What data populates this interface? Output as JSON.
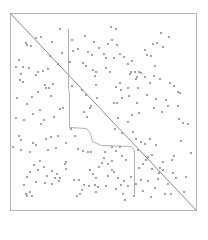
{
  "plot": {
    "frame": {
      "x": 10,
      "y": 13,
      "width": 186,
      "height": 197
    },
    "colors": {
      "frame": "#b4b4b4",
      "diagonal": "#8a8a8a",
      "path": "#b0b0b0",
      "dots": "#8c8c8c",
      "background": "#ffffff"
    },
    "diagonal": {
      "x1": 10,
      "y1": 13,
      "x2": 196,
      "y2": 210
    },
    "path_points": [
      [
        68,
        28
      ],
      [
        68,
        88
      ],
      [
        69,
        92
      ],
      [
        69,
        127
      ],
      [
        86,
        128
      ],
      [
        90,
        133
      ],
      [
        92,
        141
      ],
      [
        101,
        145
      ],
      [
        131,
        146
      ],
      [
        134,
        150
      ],
      [
        134,
        194
      ]
    ],
    "dot_radius": 1.1,
    "dots": [
      [
        60,
        29
      ],
      [
        36,
        38
      ],
      [
        41,
        37
      ],
      [
        27,
        45
      ],
      [
        31,
        46
      ],
      [
        52,
        42
      ],
      [
        62,
        53
      ],
      [
        73,
        51
      ],
      [
        72,
        40
      ],
      [
        78,
        49
      ],
      [
        70,
        62
      ],
      [
        38,
        72
      ],
      [
        43,
        71
      ],
      [
        36,
        75
      ],
      [
        48,
        69
      ],
      [
        58,
        64
      ],
      [
        45,
        85
      ],
      [
        46,
        88
      ],
      [
        49,
        88
      ],
      [
        72,
        86
      ],
      [
        26,
        43
      ],
      [
        50,
        56
      ],
      [
        19,
        60
      ],
      [
        16,
        67
      ],
      [
        23,
        67
      ],
      [
        29,
        68
      ],
      [
        21,
        74
      ],
      [
        20,
        80
      ],
      [
        23,
        82
      ],
      [
        32,
        97
      ],
      [
        38,
        92
      ],
      [
        27,
        104
      ],
      [
        17,
        98
      ],
      [
        16,
        118
      ],
      [
        24,
        120
      ],
      [
        19,
        136
      ],
      [
        21,
        140
      ],
      [
        33,
        143
      ],
      [
        41,
        124
      ],
      [
        54,
        117
      ],
      [
        51,
        96
      ],
      [
        53,
        84
      ],
      [
        40,
        110
      ],
      [
        44,
        120
      ],
      [
        60,
        109
      ],
      [
        63,
        108
      ],
      [
        13,
        147
      ],
      [
        21,
        150
      ],
      [
        36,
        145
      ],
      [
        46,
        139
      ],
      [
        51,
        137
      ],
      [
        33,
        114
      ],
      [
        48,
        150
      ],
      [
        58,
        136
      ],
      [
        71,
        129
      ],
      [
        75,
        136
      ],
      [
        78,
        149
      ],
      [
        83,
        151
      ],
      [
        88,
        152
      ],
      [
        91,
        152
      ],
      [
        66,
        143
      ],
      [
        56,
        148
      ],
      [
        30,
        152
      ],
      [
        34,
        165
      ],
      [
        38,
        170
      ],
      [
        30,
        172
      ],
      [
        27,
        177
      ],
      [
        40,
        161
      ],
      [
        44,
        167
      ],
      [
        52,
        171
      ],
      [
        55,
        178
      ],
      [
        47,
        176
      ],
      [
        57,
        174
      ],
      [
        60,
        178
      ],
      [
        36,
        182
      ],
      [
        24,
        185
      ],
      [
        26,
        194
      ],
      [
        30,
        192
      ],
      [
        27,
        196
      ],
      [
        32,
        196
      ],
      [
        45,
        183
      ],
      [
        52,
        184
      ],
      [
        59,
        181
      ],
      [
        66,
        169
      ],
      [
        65,
        164
      ],
      [
        66,
        162
      ],
      [
        74,
        180
      ],
      [
        79,
        180
      ],
      [
        82,
        190
      ],
      [
        77,
        196
      ],
      [
        80,
        194
      ],
      [
        84,
        185
      ],
      [
        89,
        186
      ],
      [
        96,
        178
      ],
      [
        95,
        185
      ],
      [
        96,
        192
      ],
      [
        98,
        187
      ],
      [
        93,
        174
      ],
      [
        90,
        170
      ],
      [
        99,
        167
      ],
      [
        102,
        163
      ],
      [
        108,
        164
      ],
      [
        114,
        172
      ],
      [
        118,
        178
      ],
      [
        112,
        170
      ],
      [
        108,
        176
      ],
      [
        106,
        186
      ],
      [
        116,
        189
      ],
      [
        121,
        185
      ],
      [
        124,
        181
      ],
      [
        128,
        186
      ],
      [
        123,
        194
      ],
      [
        131,
        177
      ],
      [
        111,
        27
      ],
      [
        116,
        29
      ],
      [
        112,
        40
      ],
      [
        117,
        45
      ],
      [
        108,
        44
      ],
      [
        104,
        54
      ],
      [
        106,
        58
      ],
      [
        114,
        58
      ],
      [
        120,
        54
      ],
      [
        124,
        57
      ],
      [
        106,
        68
      ],
      [
        110,
        72
      ],
      [
        128,
        64
      ],
      [
        132,
        61
      ],
      [
        131,
        72
      ],
      [
        135,
        72
      ],
      [
        139,
        72
      ],
      [
        130,
        74
      ],
      [
        120,
        83
      ],
      [
        116,
        87
      ],
      [
        121,
        90
      ],
      [
        128,
        88
      ],
      [
        136,
        79
      ],
      [
        99,
        48
      ],
      [
        94,
        42
      ],
      [
        85,
        36
      ],
      [
        92,
        55
      ],
      [
        88,
        52
      ],
      [
        83,
        63
      ],
      [
        86,
        66
      ],
      [
        93,
        70
      ],
      [
        96,
        72
      ],
      [
        95,
        76
      ],
      [
        96,
        85
      ],
      [
        82,
        90
      ],
      [
        86,
        95
      ],
      [
        97,
        98
      ],
      [
        91,
        106
      ],
      [
        90,
        108
      ],
      [
        84,
        112
      ],
      [
        87,
        117
      ],
      [
        153,
        44
      ],
      [
        157,
        43
      ],
      [
        161,
        33
      ],
      [
        163,
        47
      ],
      [
        169,
        37
      ],
      [
        145,
        50
      ],
      [
        147,
        55
      ],
      [
        151,
        56
      ],
      [
        155,
        66
      ],
      [
        154,
        76
      ],
      [
        150,
        83
      ],
      [
        160,
        79
      ],
      [
        170,
        83
      ],
      [
        174,
        86
      ],
      [
        178,
        92
      ],
      [
        180,
        93
      ],
      [
        178,
        106
      ],
      [
        166,
        100
      ],
      [
        145,
        77
      ],
      [
        141,
        73
      ],
      [
        137,
        77
      ],
      [
        138,
        88
      ],
      [
        147,
        95
      ],
      [
        156,
        99
      ],
      [
        154,
        108
      ],
      [
        162,
        112
      ],
      [
        168,
        106
      ],
      [
        179,
        119
      ],
      [
        183,
        123
      ],
      [
        188,
        124
      ],
      [
        181,
        141
      ],
      [
        191,
        153
      ],
      [
        174,
        156
      ],
      [
        172,
        160
      ],
      [
        163,
        162
      ],
      [
        160,
        168
      ],
      [
        163,
        170
      ],
      [
        158,
        179
      ],
      [
        168,
        184
      ],
      [
        176,
        178
      ],
      [
        173,
        173
      ],
      [
        186,
        177
      ],
      [
        114,
        103
      ],
      [
        117,
        103
      ],
      [
        122,
        98
      ],
      [
        129,
        96
      ],
      [
        137,
        103
      ],
      [
        139,
        113
      ],
      [
        132,
        115
      ],
      [
        128,
        122
      ],
      [
        118,
        118
      ],
      [
        115,
        129
      ],
      [
        122,
        133
      ],
      [
        133,
        132
      ],
      [
        136,
        139
      ],
      [
        141,
        142
      ],
      [
        145,
        144
      ],
      [
        150,
        139
      ],
      [
        156,
        145
      ],
      [
        148,
        157
      ],
      [
        146,
        160
      ],
      [
        152,
        155
      ],
      [
        138,
        150
      ],
      [
        143,
        164
      ],
      [
        152,
        169
      ],
      [
        159,
        173
      ],
      [
        120,
        147
      ],
      [
        116,
        151
      ],
      [
        112,
        147
      ],
      [
        105,
        152
      ],
      [
        104,
        158
      ],
      [
        112,
        161
      ],
      [
        122,
        156
      ],
      [
        126,
        160
      ],
      [
        139,
        168
      ],
      [
        148,
        181
      ],
      [
        155,
        188
      ],
      [
        165,
        194
      ],
      [
        171,
        194
      ],
      [
        184,
        192
      ],
      [
        141,
        180
      ],
      [
        136,
        184
      ],
      [
        143,
        191
      ],
      [
        151,
        197
      ],
      [
        134,
        196
      ],
      [
        125,
        200
      ]
    ]
  }
}
